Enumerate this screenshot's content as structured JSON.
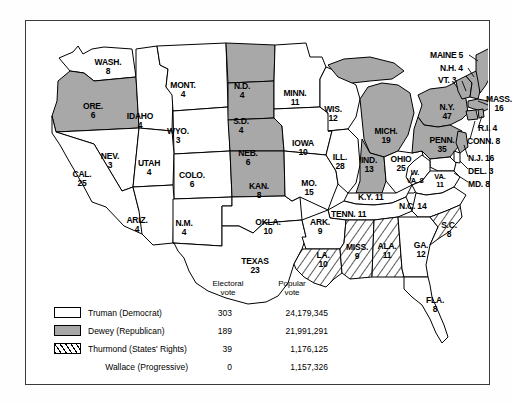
{
  "map": {
    "title": "Presidential Election of 1948",
    "colors": {
      "truman_fill": "#ffffff",
      "dewey_fill": "#a8a8a8",
      "thurmond_fill": "hatched",
      "border": "#000000",
      "frame": "#3a3a3a"
    },
    "states": [
      {
        "id": "wash",
        "name": "WASH.",
        "ev": "8",
        "party": "truman",
        "x": 82,
        "y": 45
      },
      {
        "id": "ore",
        "name": "ORE.",
        "ev": "6",
        "party": "dewey",
        "x": 67,
        "y": 89
      },
      {
        "id": "idaho",
        "name": "IDAHO",
        "ev": "4",
        "party": "truman",
        "x": 114,
        "y": 99
      },
      {
        "id": "mont",
        "name": "MONT.",
        "ev": "4",
        "party": "truman",
        "x": 157,
        "y": 68
      },
      {
        "id": "wyo",
        "name": "WYO.",
        "ev": "3",
        "party": "truman",
        "x": 152,
        "y": 114
      },
      {
        "id": "nev",
        "name": "NEV.",
        "ev": "3",
        "party": "truman",
        "x": 84,
        "y": 139
      },
      {
        "id": "utah",
        "name": "UTAH",
        "ev": "4",
        "party": "truman",
        "x": 123,
        "y": 146
      },
      {
        "id": "colo",
        "name": "COLO.",
        "ev": "6",
        "party": "truman",
        "x": 166,
        "y": 158
      },
      {
        "id": "cal",
        "name": "CAL.",
        "ev": "25",
        "party": "truman",
        "x": 56,
        "y": 157
      },
      {
        "id": "ariz",
        "name": "ARIZ.",
        "ev": "4",
        "party": "truman",
        "x": 111,
        "y": 203
      },
      {
        "id": "nm",
        "name": "N.M.",
        "ev": "4",
        "party": "truman",
        "x": 158,
        "y": 206
      },
      {
        "id": "nd",
        "name": "N.D.",
        "ev": "4",
        "party": "dewey",
        "x": 216,
        "y": 69
      },
      {
        "id": "sd",
        "name": "S.D.",
        "ev": "4",
        "party": "dewey",
        "x": 215,
        "y": 104
      },
      {
        "id": "neb",
        "name": "NEB.",
        "ev": "6",
        "party": "dewey",
        "x": 222,
        "y": 136
      },
      {
        "id": "kan",
        "name": "KAN.",
        "ev": "8",
        "party": "dewey",
        "x": 233,
        "y": 169
      },
      {
        "id": "okla",
        "name": "OKLA.",
        "ev": "10",
        "party": "truman",
        "x": 242,
        "y": 205
      },
      {
        "id": "texas",
        "name": "TEXAS",
        "ev": "23",
        "party": "truman",
        "x": 229,
        "y": 244
      },
      {
        "id": "minn",
        "name": "MINN.",
        "ev": "11",
        "party": "truman",
        "x": 269,
        "y": 76
      },
      {
        "id": "iowa",
        "name": "IOWA",
        "ev": "10",
        "party": "truman",
        "x": 277,
        "y": 126
      },
      {
        "id": "mo",
        "name": "MO.",
        "ev": "15",
        "party": "truman",
        "x": 283,
        "y": 166
      },
      {
        "id": "ark",
        "name": "ARK.",
        "ev": "9",
        "party": "truman",
        "x": 294,
        "y": 205
      },
      {
        "id": "la",
        "name": "LA.",
        "ev": "10",
        "party": "thurmond",
        "x": 297,
        "y": 238
      },
      {
        "id": "wis",
        "name": "WIS.",
        "ev": "12",
        "party": "truman",
        "x": 307,
        "y": 92
      },
      {
        "id": "ill",
        "name": "ILL.",
        "ev": "28",
        "party": "truman",
        "x": 314,
        "y": 140
      },
      {
        "id": "miss",
        "name": "MISS.",
        "ev": "9",
        "party": "thurmond",
        "x": 331,
        "y": 230
      },
      {
        "id": "mich",
        "name": "MICH.",
        "ev": "19",
        "party": "dewey",
        "x": 360,
        "y": 114
      },
      {
        "id": "ind",
        "name": "IND.",
        "ev": "13",
        "party": "dewey",
        "x": 343,
        "y": 143
      },
      {
        "id": "ohio",
        "name": "OHIO",
        "ev": "25",
        "party": "truman",
        "x": 375,
        "y": 142
      },
      {
        "id": "ala",
        "name": "ALA.",
        "ev": "11",
        "party": "thurmond",
        "x": 361,
        "y": 229
      },
      {
        "id": "ga",
        "name": "GA.",
        "ev": "12",
        "party": "truman",
        "x": 395,
        "y": 228
      },
      {
        "id": "sc",
        "name": "S.C.",
        "ev": "8",
        "party": "thurmond",
        "x": 423,
        "y": 208
      },
      {
        "id": "fla",
        "name": "FLA.",
        "ev": "8",
        "party": "truman",
        "x": 409,
        "y": 283
      },
      {
        "id": "penn",
        "name": "PENN.",
        "ev": "35",
        "party": "dewey",
        "x": 416,
        "y": 123
      },
      {
        "id": "ny",
        "name": "N.Y.",
        "ev": "47",
        "party": "dewey",
        "x": 421,
        "y": 90
      },
      {
        "id": "wva",
        "name": "W.",
        "ev": "VA. 8",
        "party": "truman",
        "x": 389,
        "y": 156
      },
      {
        "id": "va",
        "name": "VA.",
        "ev": "11",
        "party": "truman",
        "x": 414,
        "y": 160
      },
      {
        "id": "mass",
        "name": "MASS.",
        "ev": "16",
        "party": "dewey",
        "x": 474,
        "y": 82
      }
    ],
    "inline_labels": [
      {
        "id": "kentucky",
        "text": "K.Y. 11",
        "x": 359,
        "y": 176
      },
      {
        "id": "tennessee",
        "text": "TENN. 11",
        "x": 335,
        "y": 193
      },
      {
        "id": "nc",
        "text": "N.C. 14",
        "x": 398,
        "y": 185
      },
      {
        "id": "maine",
        "text": "MAINE 5",
        "x": 432,
        "y": 38
      },
      {
        "id": "nh",
        "text": "N.H. 4",
        "x": 437,
        "y": 51
      },
      {
        "id": "vt",
        "text": "VT. 3",
        "x": 430,
        "y": 63
      },
      {
        "id": "ri",
        "text": "R.I. 4",
        "x": 470,
        "y": 111
      },
      {
        "id": "conn",
        "text": "CONN. 8",
        "x": 467,
        "y": 124
      },
      {
        "id": "nj",
        "text": "N.J. 16",
        "x": 464,
        "y": 141
      },
      {
        "id": "del",
        "text": "DEL. 3",
        "x": 462,
        "y": 154
      },
      {
        "id": "md",
        "text": "MD. 8",
        "x": 461,
        "y": 167
      }
    ]
  },
  "legend": {
    "header_electoral_line1": "Electoral",
    "header_electoral_line2": "vote",
    "header_popular_line1": "Popular",
    "header_popular_line2": "vote",
    "rows": [
      {
        "id": "truman",
        "swatch": "white",
        "name": "Truman (Democrat)",
        "electoral": "303",
        "popular": "24,179,345"
      },
      {
        "id": "dewey",
        "swatch": "gray",
        "name": "Dewey (Republican)",
        "electoral": "189",
        "popular": "21,991,291"
      },
      {
        "id": "thurmond",
        "swatch": "hatch",
        "name": "Thurmond (States' Rights)",
        "electoral": "39",
        "popular": "1,176,125"
      },
      {
        "id": "wallace",
        "swatch": "none",
        "name": "Wallace (Progressive)",
        "electoral": "0",
        "popular": "1,157,326"
      }
    ]
  }
}
